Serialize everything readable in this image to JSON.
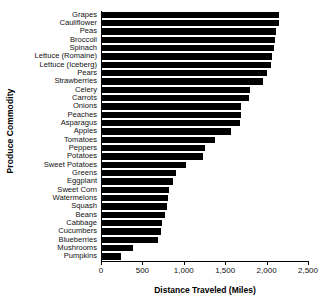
{
  "chart_data": {
    "type": "bar",
    "orientation": "horizontal",
    "title": "",
    "xlabel": "Distance Traveled (Miles)",
    "ylabel": "Produce Commodity",
    "xlim": [
      0,
      2500
    ],
    "xticks": [
      0,
      500,
      1000,
      1500,
      2000,
      2500
    ],
    "xtick_labels": [
      "0",
      "500",
      "1,000",
      "1,500",
      "2,000",
      "2,500"
    ],
    "grid": false,
    "legend": null,
    "bar_color": "#000000",
    "categories": [
      "Grapes",
      "Cauliflower",
      "Peas",
      "Broccoli",
      "Spinach",
      "Lettuce (Romaine)",
      "Lettuce (Iceberg)",
      "Pears",
      "Strawberries",
      "Celery",
      "Carrots",
      "Onions",
      "Peaches",
      "Asparagus",
      "Apples",
      "Tomatoes",
      "Peppers",
      "Potatoes",
      "Sweet Potatoes",
      "Greens",
      "Eggplant",
      "Sweet Corn",
      "Watermelons",
      "Squash",
      "Beans",
      "Cabbage",
      "Cucumbers",
      "Blueberries",
      "Mushrooms",
      "Pumpkins"
    ],
    "values": [
      2143,
      2133,
      2097,
      2095,
      2078,
      2055,
      2039,
      1997,
      1944,
      1784,
      1776,
      1675,
      1674,
      1671,
      1555,
      1369,
      1247,
      1224,
      1013,
      889,
      862,
      813,
      792,
      781,
      766,
      719,
      717,
      680,
      373,
      233
    ]
  }
}
